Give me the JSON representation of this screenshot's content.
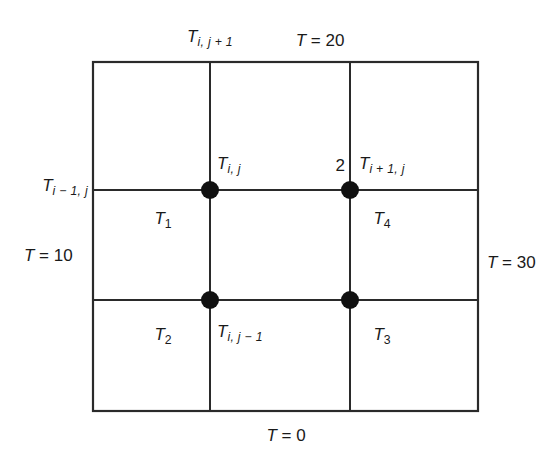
{
  "figure": {
    "type": "finite-difference-grid",
    "background_color": "#ffffff",
    "line_color": "#2a2a2a",
    "node_color": "#111111"
  },
  "boundary_conditions": {
    "top": "T = 20",
    "right": "T = 30",
    "bottom": "T = 0",
    "left": "T = 10"
  },
  "stencil_labels": {
    "center": "T",
    "center_sub": "i, j",
    "north": "T",
    "north_sub": "i, j + 1",
    "south": "T",
    "south_sub": "i, j − 1",
    "west": "T",
    "west_sub": "i − 1, j",
    "east": "T",
    "east_sub": "i + 1, j"
  },
  "region_labels": [
    {
      "symbol": "T",
      "sub": "1"
    },
    {
      "symbol": "T",
      "sub": "2"
    },
    {
      "symbol": "T",
      "sub": "3"
    },
    {
      "symbol": "T",
      "sub": "4"
    }
  ],
  "annotations": {
    "node_count": "2"
  },
  "grid": {
    "box": {
      "x": 93,
      "y": 62,
      "width": 385,
      "height": 349
    },
    "vertical_lines_x": [
      210,
      350
    ],
    "horizontal_lines_y": [
      190,
      300
    ],
    "node_radius": 9,
    "nodes": [
      {
        "name": "node-center",
        "x": 210,
        "y": 190
      },
      {
        "name": "node-east",
        "x": 350,
        "y": 190
      },
      {
        "name": "node-south",
        "x": 210,
        "y": 300
      },
      {
        "name": "node-southeast",
        "x": 350,
        "y": 300
      }
    ]
  }
}
